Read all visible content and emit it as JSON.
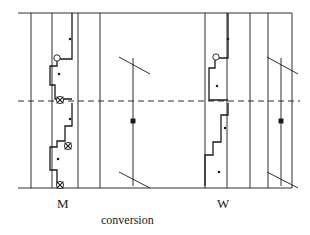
{
  "figure": {
    "width": 310,
    "height": 235,
    "background": "#ffffff",
    "stroke_color": "#1a1a1a",
    "marker_fill": "#ffffff"
  },
  "labels": {
    "left_axis_label": "M",
    "right_axis_label": "W",
    "caption": "conversion"
  },
  "frame": {
    "top_line_y": 13,
    "bottom_line_y": 188,
    "left_x": 18,
    "right_x": 292,
    "midline_y": 101,
    "midline_style": "dashed"
  },
  "chart_data": {
    "type": "line",
    "title": "conversion",
    "xlabel": "",
    "ylabel": "",
    "grid": false,
    "legend": false,
    "axis_groups": [
      {
        "name": "M",
        "label": "M",
        "x_center": 62
      },
      {
        "name": "W",
        "label": "W",
        "x_center": 222
      }
    ],
    "vertical_rules": [
      31,
      52,
      78,
      100,
      205,
      227,
      250,
      268,
      292
    ],
    "series": [
      {
        "name": "M-upper-step",
        "kind": "step",
        "points": [
          [
            72,
            13
          ],
          [
            72,
            59
          ],
          [
            57,
            59
          ],
          [
            57,
            66
          ],
          [
            50,
            66
          ],
          [
            50,
            85
          ],
          [
            55,
            85
          ],
          [
            55,
            99
          ],
          [
            72,
            99
          ]
        ]
      },
      {
        "name": "M-lower-step",
        "kind": "step",
        "points": [
          [
            72,
            103
          ],
          [
            72,
            126
          ],
          [
            65,
            126
          ],
          [
            65,
            141
          ],
          [
            57,
            141
          ],
          [
            57,
            147
          ],
          [
            50,
            147
          ],
          [
            50,
            170
          ],
          [
            57,
            170
          ],
          [
            57,
            186
          ]
        ]
      },
      {
        "name": "W-upper-step",
        "kind": "step",
        "points": [
          [
            228,
            13
          ],
          [
            228,
            58
          ],
          [
            215,
            58
          ],
          [
            215,
            68
          ],
          [
            209,
            68
          ],
          [
            209,
            100
          ],
          [
            228,
            100
          ]
        ]
      },
      {
        "name": "W-lower-step",
        "kind": "step",
        "points": [
          [
            228,
            103
          ],
          [
            228,
            115
          ],
          [
            221,
            115
          ],
          [
            221,
            142
          ],
          [
            213,
            142
          ],
          [
            213,
            155
          ],
          [
            205,
            155
          ],
          [
            205,
            186
          ]
        ]
      }
    ],
    "markers": [
      {
        "type": "open-circle",
        "x": 57,
        "y": 58,
        "series": "M"
      },
      {
        "type": "crossed-circle",
        "x": 60,
        "y": 100,
        "series": "M"
      },
      {
        "type": "crossed-circle",
        "x": 68,
        "y": 146,
        "series": "M"
      },
      {
        "type": "crossed-circle",
        "x": 60,
        "y": 185,
        "series": "M"
      },
      {
        "type": "open-circle",
        "x": 216,
        "y": 57,
        "series": "W"
      },
      {
        "type": "dot",
        "x": 70,
        "y": 39,
        "series": "M"
      },
      {
        "type": "dot",
        "x": 59,
        "y": 74,
        "series": "M"
      },
      {
        "type": "dot",
        "x": 70,
        "y": 119,
        "series": "M"
      },
      {
        "type": "dot",
        "x": 58,
        "y": 159,
        "series": "M"
      },
      {
        "type": "dot",
        "x": 228,
        "y": 39,
        "series": "W"
      },
      {
        "type": "dot",
        "x": 217,
        "y": 86,
        "series": "W"
      },
      {
        "type": "dot",
        "x": 225,
        "y": 128,
        "series": "W"
      },
      {
        "type": "dot",
        "x": 219,
        "y": 172,
        "series": "W"
      }
    ],
    "conversion_tracts": [
      {
        "name": "center-tract",
        "x": 133,
        "top_y": 58,
        "bottom_y": 186,
        "node_y": 121,
        "top_tick": [
          [
            119,
            57
          ],
          [
            150,
            74
          ]
        ],
        "bottom_tick": [
          [
            119,
            172
          ],
          [
            150,
            188
          ]
        ]
      },
      {
        "name": "right-tract",
        "x": 281,
        "top_y": 58,
        "bottom_y": 186,
        "node_y": 121,
        "top_tick": [
          [
            267,
            57
          ],
          [
            298,
            74
          ]
        ],
        "bottom_tick": [
          [
            267,
            172
          ],
          [
            298,
            188
          ]
        ]
      }
    ]
  }
}
